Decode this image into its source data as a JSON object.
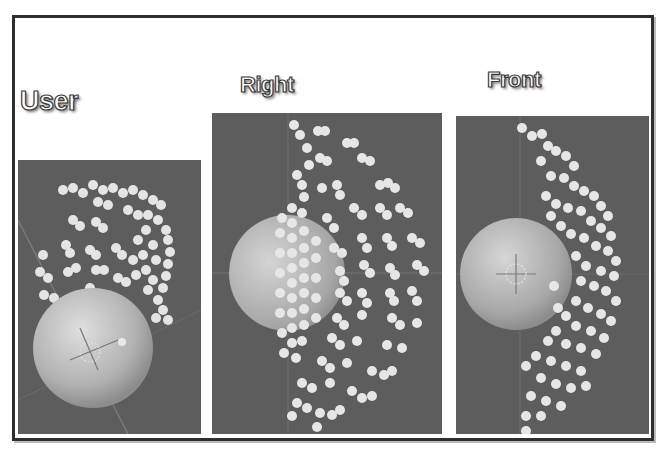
{
  "figure": {
    "panels": [
      {
        "id": "user-perspective",
        "title_lines": [
          "User",
          "Perspective",
          "View"
        ]
      },
      {
        "id": "right-orthographic",
        "title_lines": [
          "Right",
          "Orthographic",
          "View"
        ]
      },
      {
        "id": "front-orthographic",
        "title_lines": [
          "Front",
          "Orthographic",
          "View"
        ]
      }
    ],
    "colors": {
      "viewport_bg": "#5d5d5d",
      "grid_line": "#6e6e6e",
      "sphere_light": "#d9d9d9",
      "sphere_dark": "#8a8a8a",
      "particle": "#e6e6e6",
      "frame_border": "#2e2e2e"
    }
  }
}
